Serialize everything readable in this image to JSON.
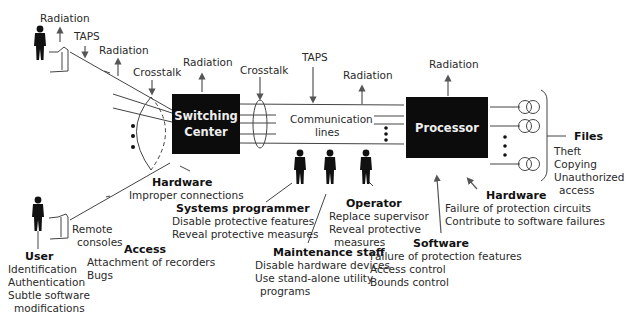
{
  "nodes": {
    "switching_center": "Switching\nCenter",
    "switching_center_line1": "Switching",
    "switching_center_line2": "Center",
    "processor": "Processor",
    "communication_lines_1": "Communication",
    "communication_lines_2": "lines",
    "files": "Files",
    "remote_consoles_1": "Remote",
    "remote_consoles_2": "consoles"
  },
  "threats": {
    "radiation": "Radiation",
    "taps": "TAPS",
    "crosstalk": "Crosstalk"
  },
  "files_threats": [
    "Theft",
    "Copying",
    "Unauthorized",
    "access"
  ],
  "groups": {
    "user": {
      "title": "User",
      "items": [
        "Identification",
        "Authentication",
        "Subtle software",
        "modifications"
      ]
    },
    "access": {
      "title": "Access",
      "items": [
        "Attachment of recorders",
        "Bugs"
      ]
    },
    "hardware_switch": {
      "title": "Hardware",
      "items": [
        "Improper connections"
      ]
    },
    "systems_programmer": {
      "title": "Systems programmer",
      "items": [
        "Disable protective features",
        "Reveal protective measures"
      ]
    },
    "maintenance_staff": {
      "title": "Maintenance staff",
      "items": [
        "Disable hardware devices",
        "Use stand-alone utility",
        "programs"
      ]
    },
    "operator": {
      "title": "Operator",
      "items": [
        "Replace supervisor",
        "Reveal protective",
        "measures"
      ]
    },
    "software": {
      "title": "Software",
      "items": [
        "Failure of protection features",
        "Access control",
        "Bounds control"
      ]
    },
    "hardware_processor": {
      "title": "Hardware",
      "items": [
        "Failure of protection circuits",
        "Contribute to software failures"
      ]
    }
  }
}
